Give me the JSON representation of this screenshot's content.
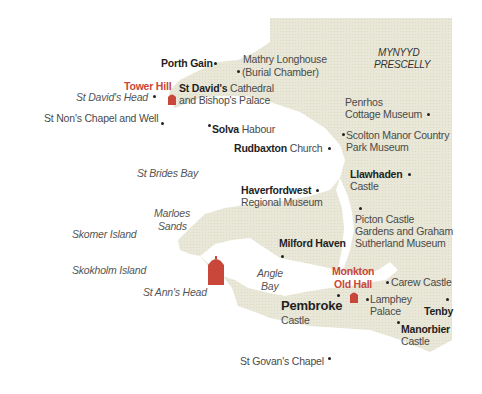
{
  "map": {
    "land_color": "#e9e7d7",
    "sea_color": "#ffffff",
    "accent_color": "#c8463a",
    "region_label": [
      "MYNYYD",
      "PRESCELLY"
    ],
    "sea_labels": {
      "st_davids_head": "St David's Head",
      "st_brides_bay": "St Brides Bay",
      "marloes_sands_1": "Marloes",
      "marloes_sands_2": "Sands",
      "skomer_island": "Skomer Island",
      "skokholm_island": "Skokholm Island",
      "st_anns_head": "St Ann's Head",
      "angle_bay_1": "Angle",
      "angle_bay_2": "Bay"
    },
    "places": {
      "porth_gain": "Porth Gain",
      "mathry_1": "Mathry Longhouse",
      "mathry_2": "(Burial Chamber)",
      "tower_hill": "Tower Hill",
      "st_davids_bold": "St David's",
      "st_davids_rest": " Cathedral",
      "st_davids_2": "and Bishop's Palace",
      "st_nons": "St Non's Chapel and Well",
      "solva_bold": "Solva",
      "solva_rest": " Habour",
      "penrhos_1": "Penrhos",
      "penrhos_2": "Cottage Museum",
      "scolton_1": "Scolton Manor Country",
      "scolton_2": "Park Museum",
      "rudbaxton_bold": "Rudbaxton",
      "rudbaxton_rest": " Church",
      "llawhaden_bold": "Llawhaden",
      "llawhaden_2": "Castle",
      "haverfordwest_bold": "Haverfordwest",
      "haverfordwest_2": "Regional Museum",
      "picton_1": "Picton Castle",
      "picton_2": "Gardens and Graham",
      "picton_3": "Sutherland Museum",
      "milford_haven": "Milford Haven",
      "monkton_1": "Monkton",
      "monkton_2": "Old Hall",
      "carew_castle": "Carew Castle",
      "pembroke_bold": "Pembroke",
      "pembroke_2": "Castle",
      "lamphey_1": "Lamphey",
      "lamphey_2": "Palace",
      "tenby": "Tenby",
      "manorbier_bold": "Manorbier",
      "manorbier_2": "Castle",
      "st_govans": "St Govan's Chapel"
    },
    "icons": [
      "tower-icon"
    ]
  }
}
